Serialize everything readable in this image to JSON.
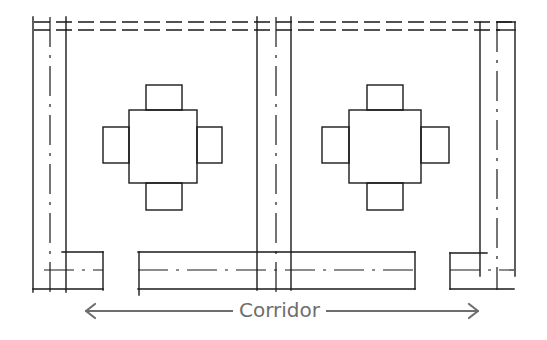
{
  "diagram": {
    "type": "architectural-plan",
    "corridor_label": "Corridor",
    "colors": {
      "linework": "#1a1a1a",
      "annotation": "#6e6e6e",
      "background": "#ffffff"
    },
    "elements": {
      "tables": [
        {
          "id": "table-left",
          "chairs": 4
        },
        {
          "id": "table-right",
          "chairs": 4
        }
      ],
      "counters": [
        "counter-left",
        "counter-center",
        "counter-right"
      ],
      "arrow": "double-headed corridor arrow"
    }
  }
}
